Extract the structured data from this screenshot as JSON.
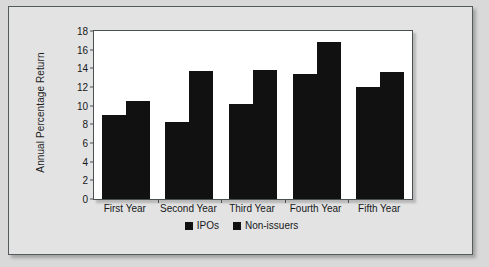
{
  "chart_data": {
    "type": "bar",
    "title": "",
    "xlabel": "",
    "ylabel": "Annual Percentage Return",
    "categories": [
      "First Year",
      "Second Year",
      "Third Year",
      "Fourth Year",
      "Fifth Year"
    ],
    "series": [
      {
        "name": "IPOs",
        "values": [
          9.0,
          8.3,
          10.2,
          13.4,
          12.0
        ]
      },
      {
        "name": "Non-issuers",
        "values": [
          10.5,
          13.7,
          13.8,
          16.8,
          13.6
        ]
      }
    ],
    "ylim": [
      0,
      18
    ],
    "yticks": [
      0,
      2,
      4,
      6,
      8,
      10,
      12,
      14,
      16,
      18
    ],
    "ytick_labels": [
      "0",
      "2",
      "4",
      "6",
      "8",
      "10",
      "12",
      "14",
      "16",
      "18"
    ],
    "grid": false,
    "legend_position": "bottom-center",
    "bar_color": "#111111",
    "plot_background": "#ffffff",
    "figure_background": "#e3e3e3"
  }
}
